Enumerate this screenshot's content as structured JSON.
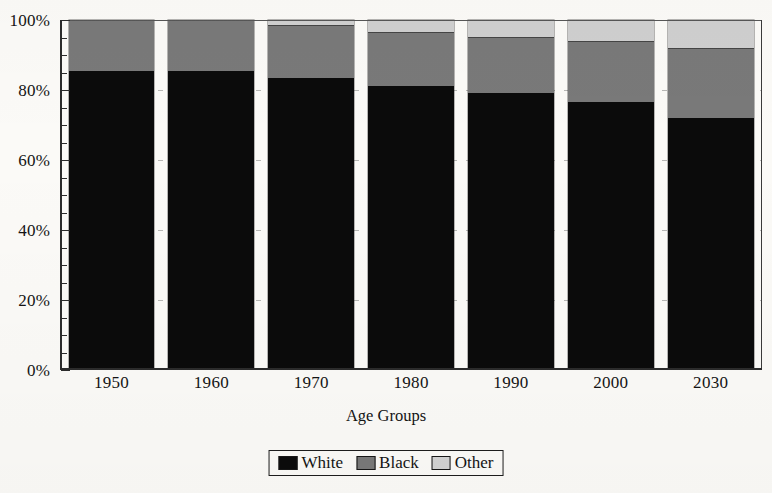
{
  "chart_data": {
    "type": "bar",
    "variant": "stacked-percent",
    "title": "",
    "xlabel": "Age Groups",
    "ylabel": "",
    "categories": [
      "1950",
      "1960",
      "1970",
      "1980",
      "1990",
      "2000",
      "2030"
    ],
    "series": [
      {
        "name": "White",
        "color": "#0b0b0b",
        "values": [
          85.5,
          85.5,
          83.5,
          81.0,
          79.0,
          76.5,
          72.0
        ]
      },
      {
        "name": "Black",
        "color": "#797979",
        "values": [
          14.5,
          14.5,
          15.0,
          15.5,
          16.0,
          17.5,
          20.0
        ]
      },
      {
        "name": "Other",
        "color": "#cfcfcf",
        "values": [
          0.0,
          0.0,
          1.5,
          3.5,
          5.0,
          6.0,
          8.0
        ]
      }
    ],
    "ylim": [
      0,
      100
    ],
    "y_ticks": [
      0,
      20,
      40,
      60,
      80,
      100
    ],
    "y_tick_labels": [
      "0%",
      "20%",
      "40%",
      "60%",
      "80%",
      "100%"
    ],
    "y_minor_tick_step": 5,
    "grid": "horizontal-dashed-faint",
    "legend": {
      "position": "bottom-center",
      "entries": [
        {
          "label": "White",
          "swatch": "white-swatch"
        },
        {
          "label": "Black",
          "swatch": "black-swatch"
        },
        {
          "label": "Other",
          "swatch": "other-swatch"
        }
      ]
    }
  }
}
